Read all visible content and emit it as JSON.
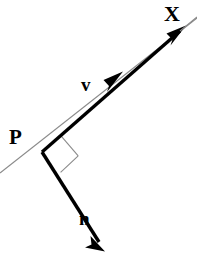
{
  "figure": {
    "background_color": "#ffffff",
    "stroke_color": "#000000",
    "thin_line_color": "#8a8a8a",
    "width": 197,
    "height": 257,
    "labels": {
      "line_label": "X",
      "tangent_label": "v",
      "point_label": "P",
      "normal_label": "n"
    },
    "geometry": {
      "point_p": {
        "x": 42,
        "y": 152
      },
      "line_x": {
        "x1": 0,
        "y1": 173,
        "x2": 197,
        "y2": 18
      },
      "tangent_vector": {
        "x1": 42,
        "y1": 152,
        "x2": 185,
        "y2": 27
      },
      "tangent_mid_arrow_tip": {
        "x": 122,
        "y": 73
      },
      "normal_vector": {
        "x1": 42,
        "y1": 152,
        "x2": 104,
        "y2": 250
      },
      "right_angle_marker_size": 30
    }
  }
}
